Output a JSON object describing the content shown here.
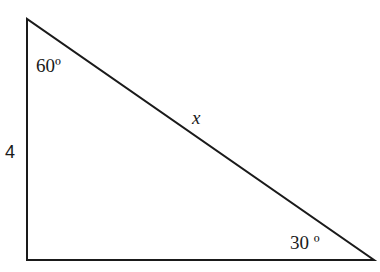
{
  "diagram": {
    "type": "right-triangle",
    "line_color": "#1a1a1a",
    "vertices": {
      "top": [
        27,
        19
      ],
      "bottom_left": [
        27,
        260
      ],
      "bottom_right": [
        374,
        260
      ]
    },
    "labels": {
      "angle_top": "60º",
      "angle_right": "30 º",
      "side_left": "4",
      "hypotenuse": "x"
    }
  }
}
